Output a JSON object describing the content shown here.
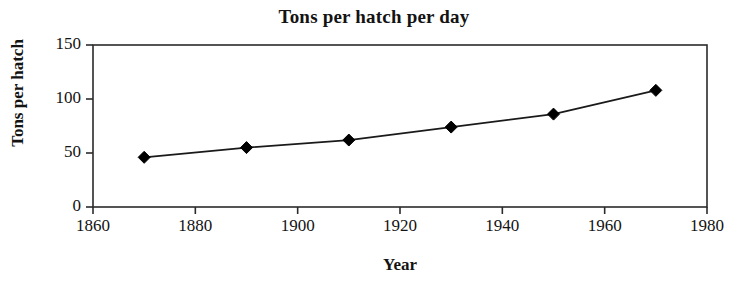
{
  "chart_data": {
    "type": "line",
    "title": "Tons per hatch per day",
    "xlabel": "Year",
    "ylabel": "Tons per hatch",
    "x": [
      1870,
      1890,
      1910,
      1930,
      1950,
      1970
    ],
    "values": [
      46,
      55,
      62,
      74,
      86,
      108
    ],
    "series": [
      {
        "name": "Tons per hatch per day",
        "values": [
          46,
          55,
          62,
          74,
          86,
          108
        ]
      }
    ],
    "xlim": [
      1860,
      1980
    ],
    "ylim": [
      0,
      150
    ],
    "xticks": [
      1860,
      1880,
      1900,
      1920,
      1940,
      1960,
      1980
    ],
    "yticks": [
      0,
      50,
      100,
      150
    ],
    "xtick_labels": [
      "1860",
      "1880",
      "1900",
      "1920",
      "1940",
      "1960",
      "1980"
    ],
    "ytick_labels": [
      "0",
      "50",
      "100",
      "150"
    ],
    "grid": false,
    "legend": false,
    "marker": "diamond",
    "line_color": "#1a1a1a",
    "marker_color": "#000000",
    "axis_color": "#2b2b2b",
    "background_color": "#ffffff"
  }
}
